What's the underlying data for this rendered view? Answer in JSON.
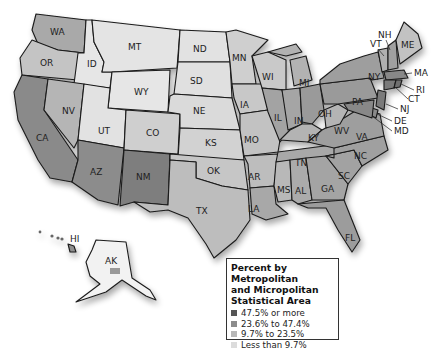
{
  "colors": {
    "background": "#ffffff",
    "border": "#1a1a1a",
    "levels": [
      "#555555",
      "#8c8c8c",
      "#b8b8b8",
      "#dcdcdc"
    ],
    "land_base": "#ffffff"
  },
  "legend": {
    "title_line1": "Percent by Metropolitan",
    "title_line2": "and Micropolitan",
    "title_line3": "Statistical Area",
    "items": [
      {
        "label": "47.5% or more",
        "color": "#555555"
      },
      {
        "label": "23.6% to 47.4%",
        "color": "#8c8c8c"
      },
      {
        "label": "9.7% to 23.5%",
        "color": "#b8b8b8"
      },
      {
        "label": "Less than 9.7%",
        "color": "#dcdcdc"
      }
    ]
  },
  "states": {
    "WA": "WA",
    "OR": "OR",
    "CA": "CA",
    "ID": "ID",
    "NV": "NV",
    "MT": "MT",
    "WY": "WY",
    "UT": "UT",
    "AZ": "AZ",
    "CO": "CO",
    "NM": "NM",
    "ND": "ND",
    "SD": "SD",
    "NE": "NE",
    "KS": "KS",
    "OK": "OK",
    "TX": "TX",
    "MN": "MN",
    "IA": "IA",
    "MO": "MO",
    "AR": "AR",
    "LA": "LA",
    "WI": "WI",
    "IL": "IL",
    "MI": "MI",
    "IN": "IN",
    "OH": "OH",
    "KY": "KY",
    "TN": "TN",
    "MS": "MS",
    "AL": "AL",
    "GA": "GA",
    "FL": "FL",
    "SC": "SC",
    "NC": "NC",
    "VA": "VA",
    "WV": "WV",
    "PA": "PA",
    "NY": "NY",
    "VT": "VT",
    "NH": "NH",
    "ME": "ME",
    "MA": "MA",
    "RI": "RI",
    "CT": "CT",
    "NJ": "NJ",
    "DE": "DE",
    "MD": "MD",
    "AK": "AK",
    "HI": "HI"
  }
}
